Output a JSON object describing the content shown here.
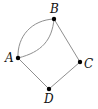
{
  "diagram": {
    "type": "graph",
    "style": {
      "edge_color": "#8f8f8f",
      "vertex_color": "#000000",
      "background": "#ffffff"
    },
    "vertices": [
      {
        "id": "A",
        "label": "A",
        "x": 18,
        "y": 58,
        "label_x": 5,
        "label_y": 62
      },
      {
        "id": "B",
        "label": "B",
        "x": 54,
        "y": 19,
        "label_x": 50,
        "label_y": 13
      },
      {
        "id": "C",
        "label": "C",
        "x": 80,
        "y": 62,
        "label_x": 84,
        "label_y": 68
      },
      {
        "id": "D",
        "label": "D",
        "x": 49,
        "y": 89,
        "label_x": 44,
        "label_y": 103
      }
    ],
    "edges": [
      {
        "id": "AB-upper",
        "from": "A",
        "to": "B",
        "curved": true
      },
      {
        "id": "AB-lower",
        "from": "A",
        "to": "B",
        "curved": true
      },
      {
        "id": "BC",
        "from": "B",
        "to": "C",
        "curved": false
      },
      {
        "id": "CD",
        "from": "C",
        "to": "D",
        "curved": false
      },
      {
        "id": "DA",
        "from": "D",
        "to": "A",
        "curved": false
      }
    ]
  }
}
